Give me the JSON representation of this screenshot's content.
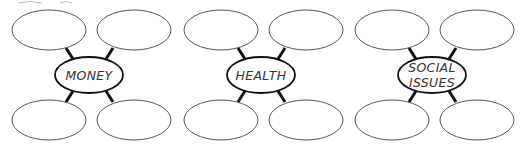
{
  "diagram": {
    "type": "spider-map",
    "groups": [
      {
        "topic_lines": [
          "MONEY"
        ],
        "branch_count": 4,
        "branch_texts": [
          "",
          "",
          "",
          ""
        ]
      },
      {
        "topic_lines": [
          "HEALTH"
        ],
        "branch_count": 4,
        "branch_texts": [
          "",
          "",
          "",
          ""
        ]
      },
      {
        "topic_lines": [
          "SOCIAL",
          "ISSUES"
        ],
        "branch_count": 4,
        "branch_texts": [
          "",
          "",
          "",
          ""
        ]
      }
    ]
  }
}
